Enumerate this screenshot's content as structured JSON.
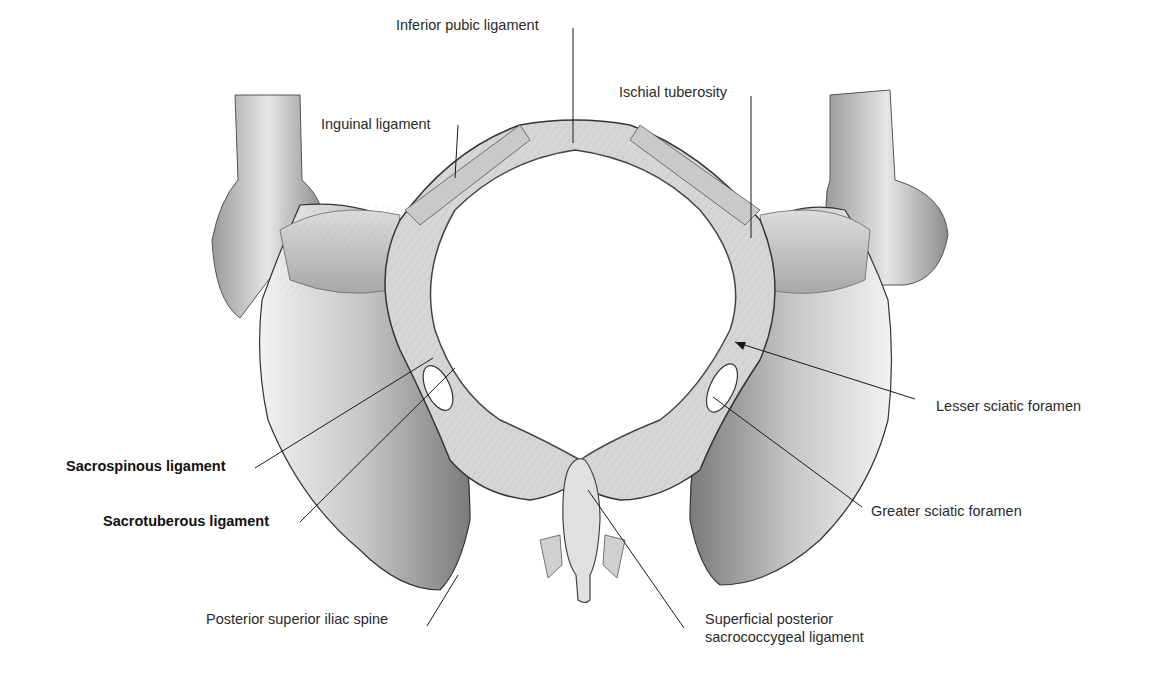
{
  "figure": {
    "colors": {
      "background": "#ffffff",
      "line": "#1a1a1a",
      "bone_light": "#e4e4e4",
      "bone_mid": "#b9b9b9",
      "bone_dark": "#6e6e6e"
    }
  },
  "labels": {
    "inferior_pubic_ligament": "Inferior pubic ligament",
    "inguinal_ligament": "Inguinal ligament",
    "ischial_tuberosity": "Ischial tuberosity",
    "lesser_sciatic_foramen": "Lesser sciatic foramen",
    "greater_sciatic_foramen": "Greater sciatic foramen",
    "sacrospinous_ligament": "Sacrospinous ligament",
    "sacrotuberous_ligament": "Sacrotuberous ligament",
    "posterior_superior_iliac_spine": "Posterior superior iliac spine",
    "superficial_posterior_sacrococcygeal_ligament_line1": "Superficial posterior",
    "superficial_posterior_sacrococcygeal_ligament_line2": "sacrococcygeal ligament"
  }
}
